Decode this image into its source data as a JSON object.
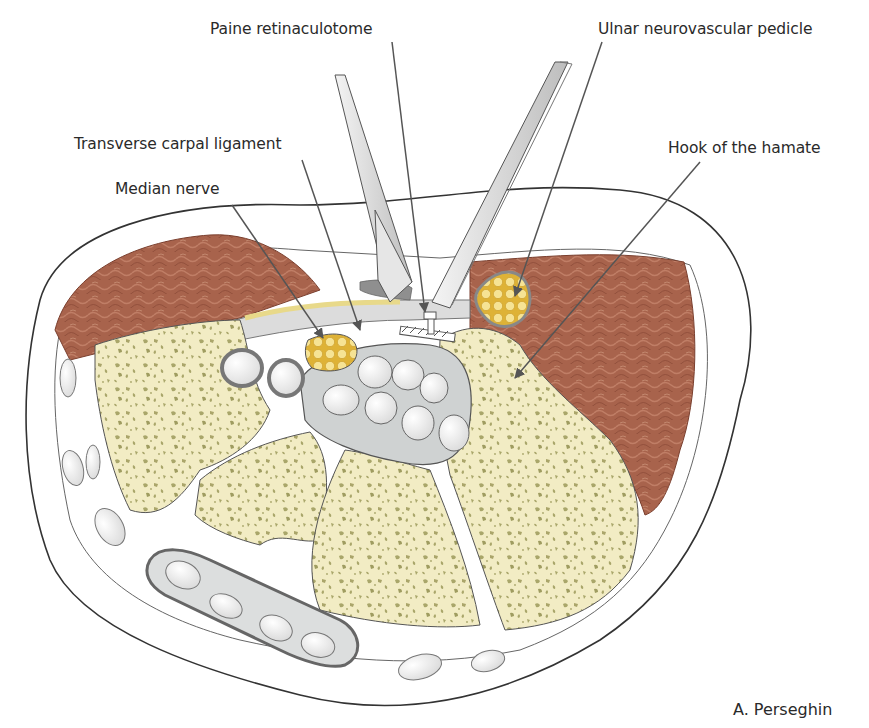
{
  "figure": {
    "labels": [
      {
        "id": "paine-retinaculotome",
        "text": "Paine retinaculotome",
        "x": 210,
        "y": 20
      },
      {
        "id": "ulnar-neurovascular-pedicle",
        "text": "Ulnar neurovascular pedicle",
        "x": 598,
        "y": 20
      },
      {
        "id": "transverse-carpal-ligament",
        "text": "Transverse carpal ligament",
        "x": 74,
        "y": 135
      },
      {
        "id": "median-nerve",
        "text": "Median nerve",
        "x": 115,
        "y": 180
      },
      {
        "id": "hook-of-the-hamate",
        "text": "Hook of the hamate",
        "x": 668,
        "y": 139
      }
    ],
    "credit": "A. Perseghin"
  },
  "colors": {
    "muscle": "#a5604a",
    "muscle_dark": "#8a4a38",
    "bone": "#f2ecc4",
    "bone_spots": "#a9a66a",
    "nerve": "#e3b83e",
    "nerve_fascicle": "#f4e08a",
    "tendon_sheath": "#c9cccc",
    "tendon": "#f4f4f4",
    "outline": "#444444",
    "instrument": "#e2e2e2",
    "leader": "#555555"
  }
}
